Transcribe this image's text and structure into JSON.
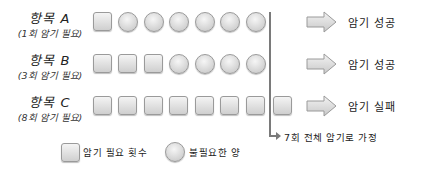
{
  "rows": [
    {
      "label": "항목 A",
      "sublabel": "(1회 암기 필요)",
      "required": 1,
      "shapes": [
        "square",
        "circle",
        "circle",
        "circle",
        "circle",
        "circle",
        "circle"
      ],
      "result": "암기 성공"
    },
    {
      "label": "항목 B",
      "sublabel": "(3회 암기 필요)",
      "required": 3,
      "shapes": [
        "square",
        "square",
        "square",
        "circle",
        "circle",
        "circle",
        "circle"
      ],
      "result": "암기 성공"
    },
    {
      "label": "항목 C",
      "sublabel": "(8회 암기 필요)",
      "required": 8,
      "shapes": [
        "square",
        "square",
        "square",
        "square",
        "square",
        "square",
        "square",
        "square"
      ],
      "result": "암기 실패"
    }
  ],
  "cutoff_note": "7회 전체 암기로 가정",
  "legend": {
    "square_label": "암기 필요 횟수",
    "circle_label": "불필요한 양"
  },
  "colors": {
    "shape_fill": "#dddddd",
    "shape_border": "#9a9a9a",
    "line": "#7a7a7a",
    "text": "#222222"
  }
}
